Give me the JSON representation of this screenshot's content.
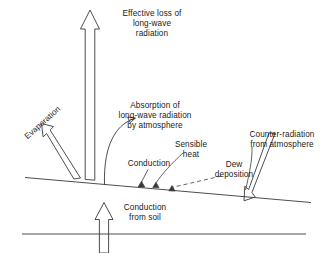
{
  "diagram": {
    "background_color": "#ffffff",
    "line_color": "#3a3a3a",
    "text_color": "#1a1a1a",
    "labels": {
      "effective_loss": "Effective loss of\nlong-wave\nradiation",
      "absorption": "Absorption of\nlong-wave radiation\nby atmosphere",
      "evaporation": "Evaporation",
      "sensible_heat": "Sensible\nheat",
      "conduction": "Conduction",
      "dew_deposition": "Dew\ndeposition",
      "counter_radiation": "Counter-radiation\nfrom atmosphere",
      "conduction_from_soil": "Conduction\nfrom soil"
    },
    "elements": {
      "ground_surface_line": "sloping-ground-line",
      "subsoil_line": "horizontal-subsoil-line",
      "upward_longwave_arrow": "hollow-up-arrow",
      "evaporation_arrow": "hollow-diagonal-up-left-arrow",
      "absorption_arrow": "curved-arrow-up-right",
      "counter_radiation_arrow": "hollow-down-arrow",
      "soil_conduction_arrow": "hollow-up-arrow",
      "conduction_marker": "small-triangle-marker",
      "sensible_heat_marker": "small-triangle-marker",
      "dew_marker": "small-triangle-marker",
      "dew_leader": "dashed-leader-line"
    }
  }
}
